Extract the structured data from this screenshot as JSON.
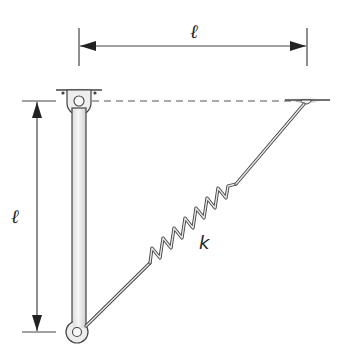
{
  "diagram": {
    "type": "mechanics-figure",
    "labels": {
      "horizontal_length": "ℓ",
      "vertical_length": "ℓ",
      "spring_constant": "k"
    },
    "elements": [
      {
        "id": "top-support",
        "kind": "ceiling-support"
      },
      {
        "id": "right-support",
        "kind": "ceiling-support"
      },
      {
        "id": "rod",
        "kind": "rigid-bar",
        "length_label": "ℓ"
      },
      {
        "id": "top-pin",
        "kind": "hinge"
      },
      {
        "id": "bottom-pin",
        "kind": "hinge"
      },
      {
        "id": "spring",
        "kind": "spring",
        "label": "k"
      },
      {
        "id": "reference-line",
        "kind": "dashed-line"
      },
      {
        "id": "horizontal-dimension",
        "kind": "dimension-arrow",
        "label": "ℓ"
      },
      {
        "id": "vertical-dimension",
        "kind": "dimension-arrow",
        "label": "ℓ"
      }
    ],
    "colors": {
      "stroke": "#333333",
      "rod_fill": "#ececec",
      "support_shade": "#9a9a9a"
    }
  }
}
